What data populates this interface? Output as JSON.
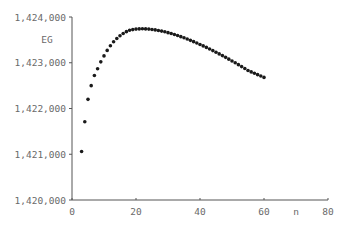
{
  "chart_data": {
    "type": "scatter",
    "title": "",
    "xlabel": "n",
    "ylabel": "EG",
    "xlim": [
      0,
      80
    ],
    "ylim": [
      1420000,
      1424000
    ],
    "x_ticks": [
      0,
      20,
      40,
      60,
      80
    ],
    "x_tick_labels": [
      "0",
      "20",
      "40",
      "60",
      "80"
    ],
    "y_ticks": [
      1420000,
      1421000,
      1422000,
      1423000,
      1424000
    ],
    "y_tick_labels": [
      "1,420,000",
      "1,421,000",
      "1,422,000",
      "1,423,000",
      "1,424,000"
    ],
    "grid": false,
    "legend": null,
    "marker_color": "#1a1a1a",
    "series": [
      {
        "name": "EG",
        "x": [
          3,
          4,
          5,
          6,
          7,
          8,
          9,
          10,
          11,
          12,
          13,
          14,
          15,
          16,
          17,
          18,
          19,
          20,
          21,
          22,
          23,
          24,
          25,
          26,
          27,
          28,
          29,
          30,
          31,
          32,
          33,
          34,
          35,
          36,
          37,
          38,
          39,
          40,
          41,
          42,
          43,
          44,
          45,
          46,
          47,
          48,
          49,
          50,
          51,
          52,
          53,
          54,
          55,
          56,
          57,
          58,
          59,
          60
        ],
        "y": [
          1421060,
          1421710,
          1422200,
          1422500,
          1422720,
          1422870,
          1423020,
          1423150,
          1423270,
          1423370,
          1423460,
          1423530,
          1423590,
          1423640,
          1423680,
          1423710,
          1423725,
          1423735,
          1423740,
          1423742,
          1423740,
          1423735,
          1423728,
          1423718,
          1423706,
          1423692,
          1423676,
          1423658,
          1423638,
          1423617,
          1423594,
          1423570,
          1423545,
          1423518,
          1423490,
          1423461,
          1423431,
          1423400,
          1423368,
          1423335,
          1423301,
          1423266,
          1423230,
          1423193,
          1423156,
          1423118,
          1423079,
          1423039,
          1422999,
          1422958,
          1422916,
          1422874,
          1422831,
          1422800,
          1422770,
          1422740,
          1422710,
          1422680
        ]
      }
    ]
  }
}
